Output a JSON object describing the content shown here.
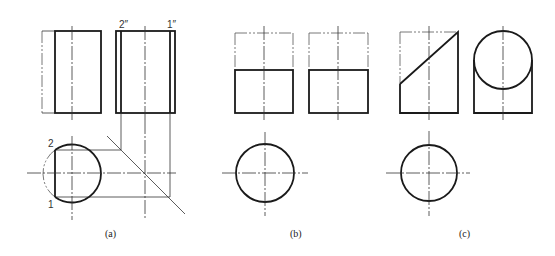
{
  "figure": {
    "panels": [
      {
        "id": "a",
        "caption": "(a)",
        "point_labels": {
          "front_top": "2",
          "front_bottom": "1",
          "side_left": "2″",
          "side_right": "1″"
        },
        "description": "Cylinder cut by vertical plane: front view, side view and top view with 45-degree miter projection line"
      },
      {
        "id": "b",
        "caption": "(b)",
        "description": "Cylinder cut by horizontal plane: front view, side view (upper part phantom) and top view circle"
      },
      {
        "id": "c",
        "caption": "(c)",
        "description": "Cylinder cut by inclined plane: front view with diagonal cut, side view showing ellipse, top view circle"
      }
    ],
    "colors": {
      "line": "#1a1a1a",
      "thin_line": "#333333",
      "background": "#ffffff"
    }
  }
}
